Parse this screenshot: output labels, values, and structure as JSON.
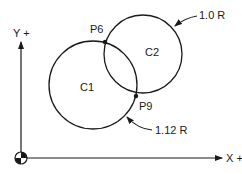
{
  "axes": {
    "x_label": "X +",
    "y_label": "Y +"
  },
  "circles": [
    {
      "name": "C1",
      "label": "C1",
      "radius_label": "1.12 R"
    },
    {
      "name": "C2",
      "label": "C2",
      "radius_label": "1.0 R"
    }
  ],
  "points": [
    {
      "label": "P6"
    },
    {
      "label": "P9"
    }
  ],
  "colors": {
    "stroke": "#1a1a1a",
    "background": "#ffffff"
  }
}
